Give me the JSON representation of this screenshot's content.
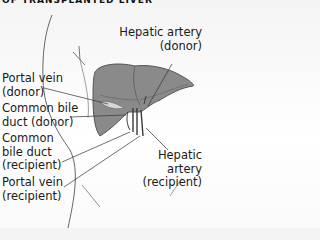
{
  "title": "OF TRANSPLANTED LIVER",
  "labels": {
    "hepatic_artery_donor": [
      "Hepatic artery",
      "(donor)"
    ],
    "portal_vein_donor": [
      "Portal vein",
      "(donor)"
    ],
    "common_bile_duct_donor": [
      "Common bile",
      "duct (donor)"
    ],
    "common_bile_duct_recipient": [
      "Common",
      "bile duct",
      "(recipient)"
    ],
    "portal_vein_recipient": [
      "Portal vein",
      "(recipient)"
    ],
    "hepatic_artery_recipient": [
      "Hepatic",
      "artery",
      "(recipient)"
    ]
  },
  "colors": {
    "liver_fill": "#8a8a8a",
    "liver_light": "#a6a6a6",
    "outline": "#555555",
    "leader_line": "#333333"
  }
}
